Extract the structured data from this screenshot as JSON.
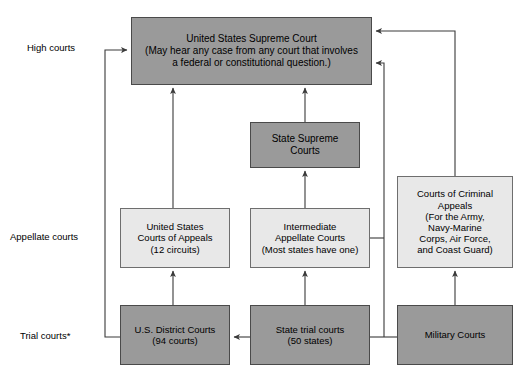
{
  "diagram": {
    "colors": {
      "dark_box": "#9a9a9a",
      "light_box": "#e8e8e8",
      "line": "#3a3a3a",
      "text": "#000000",
      "background": "#ffffff"
    },
    "tier_labels": [
      {
        "id": "high-courts",
        "text": "High courts"
      },
      {
        "id": "appellate-courts",
        "text": "Appellate courts"
      },
      {
        "id": "trial-courts",
        "text": "Trial courts*"
      }
    ],
    "nodes": [
      {
        "id": "united-states-supreme-court",
        "text": "United States Supreme Court\n(May hear any case from any court that involves\na federal or constitutional question.)",
        "shade": "dark",
        "tier": "High courts"
      },
      {
        "id": "state-supreme-courts",
        "text": "State Supreme\nCourts",
        "shade": "dark",
        "tier": "High courts"
      },
      {
        "id": "united-states-courts-of-appeals",
        "text": "United States\nCourts of Appeals\n(12 circuits)",
        "shade": "light",
        "tier": "Appellate courts"
      },
      {
        "id": "intermediate-appellate-courts",
        "text": "Intermediate\nAppellate Courts\n(Most states have one)",
        "shade": "light",
        "tier": "Appellate courts"
      },
      {
        "id": "courts-of-criminal-appeals",
        "text": "Courts of Criminal\nAppeals\n(For the Army,\nNavy-Marine\nCorps, Air Force,\nand Coast Guard)",
        "shade": "light",
        "tier": "Appellate courts"
      },
      {
        "id": "us-district-courts",
        "text": "U.S. District Courts\n(94 courts)",
        "shade": "dark",
        "tier": "Trial courts*"
      },
      {
        "id": "state-trial-courts",
        "text": "State trial courts\n(50 states)",
        "shade": "dark",
        "tier": "Trial courts*"
      },
      {
        "id": "military-courts",
        "text": "Military Courts",
        "shade": "dark",
        "tier": "Trial courts*"
      }
    ],
    "connections": [
      {
        "from": "united-states-courts-of-appeals",
        "to": "united-states-supreme-court"
      },
      {
        "from": "state-supreme-courts",
        "to": "united-states-supreme-court"
      },
      {
        "from": "intermediate-appellate-courts",
        "to": "state-supreme-courts"
      },
      {
        "from": "us-district-courts",
        "to": "united-states-courts-of-appeals"
      },
      {
        "from": "state-trial-courts",
        "to": "intermediate-appellate-courts"
      },
      {
        "from": "military-courts",
        "to": "courts-of-criminal-appeals"
      },
      {
        "from": "courts-of-criminal-appeals",
        "to": "united-states-supreme-court"
      },
      {
        "from": "state-trial-courts",
        "to": "us-district-courts"
      },
      {
        "from": "us-district-courts",
        "to": "united-states-supreme-court"
      },
      {
        "from": "state-trial-courts",
        "to": "united-states-supreme-court"
      }
    ]
  }
}
